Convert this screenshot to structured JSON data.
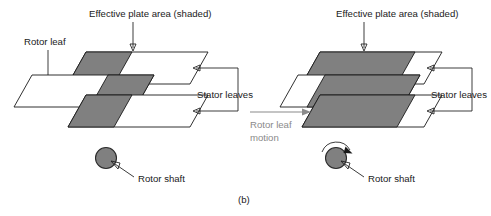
{
  "figure": {
    "caption": "(b)",
    "background_color": "#ffffff",
    "line_color": "#1a1a1a",
    "shade_color": "#808080",
    "motion_color": "#8a8a8a"
  },
  "left_diagram": {
    "name": "rotor-stator-minimum-overlap",
    "labels": {
      "effective_plate_area": "Effective plate area (shaded)",
      "rotor_leaf": "Rotor leaf",
      "stator_leaves": "Stator leaves",
      "rotor_shaft": "Rotor shaft"
    },
    "plates": [
      {
        "role": "stator-leaf-top",
        "shaded_fraction": 0.38
      },
      {
        "role": "rotor-leaf-middle",
        "shaded_fraction": 0.38
      },
      {
        "role": "stator-leaf-bottom",
        "shaded_fraction": 0.38
      }
    ]
  },
  "right_diagram": {
    "name": "rotor-stator-maximum-overlap",
    "labels": {
      "effective_plate_area": "Effective plate area (shaded)",
      "stator_leaves": "Stator leaves",
      "rotor_shaft": "Rotor shaft",
      "rotor_leaf_motion_line1": "Rotor leaf",
      "rotor_leaf_motion_line2": "motion"
    },
    "plates": [
      {
        "role": "stator-leaf-top",
        "shaded_fraction": 0.78
      },
      {
        "role": "rotor-leaf-middle",
        "shaded_fraction": 0.78
      },
      {
        "role": "stator-leaf-bottom",
        "shaded_fraction": 0.78
      }
    ]
  }
}
